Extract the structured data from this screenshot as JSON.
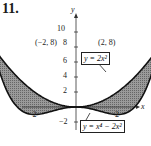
{
  "problem_number": "11.",
  "points": {
    "left": "(−2, 8)",
    "right": "(2, 8)"
  },
  "axis": {
    "x_label": "x",
    "y_label": "y",
    "x_ticks": [
      "−2",
      "2"
    ],
    "y_ticks": [
      "10",
      "8",
      "6",
      "4",
      "2",
      "−2"
    ]
  },
  "labels": {
    "curve1": "y = 2x²",
    "curve2": "y = x⁴ − 2x²"
  },
  "chart_data": {
    "type": "line",
    "title": "",
    "xlabel": "x",
    "ylabel": "y",
    "xlim": [
      -2.5,
      2.5
    ],
    "ylim": [
      -3,
      12
    ],
    "grid": false,
    "series": [
      {
        "name": "y = 2x^2",
        "x": [
          -2.2,
          -2,
          -1,
          0,
          1,
          2,
          2.2
        ],
        "values": [
          9.68,
          8,
          2,
          0,
          2,
          8,
          9.68
        ]
      },
      {
        "name": "y = x^4 - 2x^2",
        "x": [
          -2.2,
          -2,
          -1,
          0,
          1,
          2,
          2.2
        ],
        "values": [
          13.74,
          8,
          -1,
          0,
          -1,
          8,
          13.74
        ]
      }
    ],
    "annotations": [
      "(-2, 8)",
      "(2, 8)",
      "shaded region between curves on [-2, 2]"
    ],
    "intersections": [
      [
        -2,
        8
      ],
      [
        0,
        0
      ],
      [
        2,
        8
      ]
    ]
  }
}
